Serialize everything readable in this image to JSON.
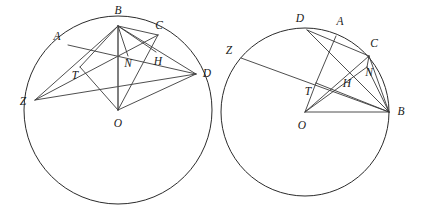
{
  "figure": {
    "stroke_color": "#3a3a3a",
    "circle_color": "#2b2b2b",
    "background_color": "#ffffff"
  },
  "left_diagram": {
    "name": "left-circle-figure",
    "circle": {
      "cx": 118,
      "cy": 110,
      "r": 94
    },
    "points": {
      "B": {
        "x": 118,
        "y": 26,
        "label": "B",
        "label_x": 118,
        "label_y": 11
      },
      "O": {
        "x": 118,
        "y": 110,
        "label": "O",
        "label_x": 118,
        "label_y": 124
      },
      "Z": {
        "x": 35,
        "y": 100,
        "label": "Z",
        "label_x": 23,
        "label_y": 102
      },
      "D": {
        "x": 196,
        "y": 74,
        "label": "D",
        "label_x": 207,
        "label_y": 74
      },
      "A": {
        "x": 68,
        "y": 45,
        "label": "A",
        "label_x": 57,
        "label_y": 37
      },
      "C": {
        "x": 158,
        "y": 35,
        "label": "C",
        "label_x": 159,
        "label_y": 26
      },
      "T": {
        "x": 80,
        "y": 67,
        "label": "T",
        "label_x": 75,
        "label_y": 76
      },
      "N": {
        "x": 128,
        "y": 56,
        "label": "N",
        "label_x": 128,
        "label_y": 64
      },
      "H": {
        "x": 156,
        "y": 52,
        "label": "H",
        "label_x": 158,
        "label_y": 62
      }
    },
    "segments": [
      {
        "name": "segment-A-to-D",
        "from": "A",
        "to": "D"
      },
      {
        "name": "segment-Z-to-C",
        "from": "Z",
        "to": "C"
      },
      {
        "name": "segment-Z-to-D",
        "from": "Z",
        "to": "D"
      },
      {
        "name": "segment-Z-to-B",
        "from": "Z",
        "to": "B"
      },
      {
        "name": "segment-B-to-D",
        "from": "B",
        "to": "D"
      },
      {
        "name": "segment-B-to-C",
        "from": "B",
        "to": "C"
      },
      {
        "name": "segment-B-to-H",
        "from": "B",
        "to": "H"
      },
      {
        "name": "segment-B-to-T",
        "from": "B",
        "to": "T"
      },
      {
        "name": "segment-B-to-O",
        "from": "B",
        "to": "O",
        "bold": true
      },
      {
        "name": "segment-O-to-T",
        "from": "O",
        "to": "T"
      },
      {
        "name": "segment-O-to-D",
        "from": "O",
        "to": "D"
      },
      {
        "name": "segment-O-to-C",
        "from": "O",
        "to": "C"
      },
      {
        "name": "segment-B-to-N",
        "from": "B",
        "to": "N"
      }
    ]
  },
  "right_diagram": {
    "name": "right-circle-figure",
    "circle": {
      "cx": 305,
      "cy": 112,
      "r": 84
    },
    "points": {
      "O": {
        "x": 305,
        "y": 112,
        "label": "O",
        "label_x": 302,
        "label_y": 126
      },
      "B": {
        "x": 389,
        "y": 112,
        "label": "B",
        "label_x": 401,
        "label_y": 112
      },
      "Z": {
        "x": 241,
        "y": 58,
        "label": "Z",
        "label_x": 229,
        "label_y": 51
      },
      "D": {
        "x": 307,
        "y": 30,
        "label": "D",
        "label_x": 300,
        "label_y": 19
      },
      "A": {
        "x": 336,
        "y": 36,
        "label": "A",
        "label_x": 340,
        "label_y": 22
      },
      "C": {
        "x": 369,
        "y": 56,
        "label": "C",
        "label_x": 374,
        "label_y": 44
      },
      "T": {
        "x": 316,
        "y": 83,
        "label": "T",
        "label_x": 308,
        "label_y": 92
      },
      "H": {
        "x": 349,
        "y": 76,
        "label": "H",
        "label_x": 347,
        "label_y": 84
      },
      "N": {
        "x": 367,
        "y": 67,
        "label": "N",
        "label_x": 369,
        "label_y": 73
      }
    },
    "segments": [
      {
        "name": "segment-D-to-B",
        "from": "D",
        "to": "B"
      },
      {
        "name": "segment-A-to-T",
        "from": "A",
        "to": "T"
      },
      {
        "name": "segment-D-to-C",
        "from": "D",
        "to": "C"
      },
      {
        "name": "segment-Z-to-B",
        "from": "Z",
        "to": "B"
      },
      {
        "name": "segment-C-to-B",
        "from": "C",
        "to": "B"
      },
      {
        "name": "segment-C-to-N",
        "from": "C",
        "to": "N"
      },
      {
        "name": "segment-N-to-B",
        "from": "N",
        "to": "B"
      },
      {
        "name": "segment-O-to-T",
        "from": "O",
        "to": "T"
      },
      {
        "name": "segment-O-to-N",
        "from": "O",
        "to": "N"
      },
      {
        "name": "segment-O-to-C",
        "from": "O",
        "to": "C"
      },
      {
        "name": "segment-O-to-B",
        "from": "O",
        "to": "B"
      },
      {
        "name": "segment-T-to-B",
        "from": "T",
        "to": "B"
      }
    ]
  }
}
